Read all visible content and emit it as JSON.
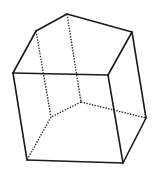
{
  "figure": {
    "stroke_color": "#1a1a1a",
    "background": "#ffffff",
    "vertices": {
      "A": [
        67,
        14
      ],
      "B": [
        36,
        31
      ],
      "C": [
        132,
        32
      ],
      "D": [
        13,
        73
      ],
      "E": [
        108,
        75
      ],
      "F": [
        81,
        102
      ],
      "G": [
        51,
        117
      ],
      "H": [
        146,
        118
      ],
      "I": [
        27,
        160
      ],
      "J": [
        123,
        163
      ]
    },
    "solid_edges": [
      [
        "A",
        "B"
      ],
      [
        "A",
        "C"
      ],
      [
        "B",
        "D"
      ],
      [
        "C",
        "E"
      ],
      [
        "C",
        "H"
      ],
      [
        "D",
        "E"
      ],
      [
        "D",
        "I"
      ],
      [
        "E",
        "J"
      ],
      [
        "I",
        "J"
      ],
      [
        "J",
        "H"
      ]
    ],
    "hidden_edges": [
      [
        "A",
        "F"
      ],
      [
        "B",
        "G"
      ],
      [
        "F",
        "G"
      ],
      [
        "G",
        "I"
      ],
      [
        "F",
        "H"
      ]
    ]
  }
}
